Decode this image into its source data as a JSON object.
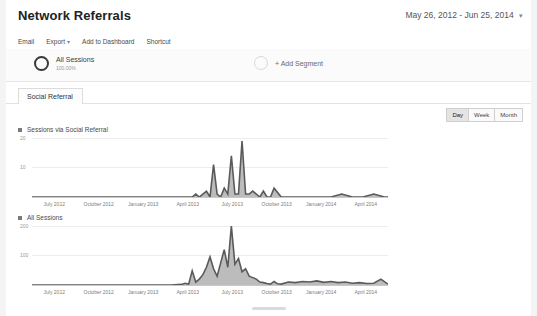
{
  "header": {
    "title": "Network Referrals",
    "date_range": "May 26, 2012 - Jun 25, 2014",
    "date_caret": "▾"
  },
  "toolbar": {
    "email": "Email",
    "export": "Export",
    "export_caret": "▾",
    "add_to_dashboard": "Add to Dashboard",
    "shortcut": "Shortcut"
  },
  "segments": {
    "all_sessions_name": "All Sessions",
    "all_sessions_pct": "100.00%",
    "add_segment": "+ Add Segment"
  },
  "tabs": [
    {
      "label": "Social Referral",
      "active": true
    }
  ],
  "granularity": [
    {
      "label": "Day",
      "active": true
    },
    {
      "label": "Week",
      "active": false
    },
    {
      "label": "Month",
      "active": false
    }
  ],
  "chart_data": [
    {
      "type": "area",
      "title": "Sessions via Social Referral",
      "xlabel": "",
      "ylabel": "",
      "ylim": [
        0,
        20
      ],
      "ytick_labels": [
        "20",
        "10"
      ],
      "grid": true,
      "legend_position": "top-left",
      "xtick_labels": [
        "July 2012",
        "October 2012",
        "January 2013",
        "April 2013",
        "July 2013",
        "October 2013",
        "January 2014",
        "April 2014"
      ],
      "x": [
        0,
        3,
        6,
        9,
        12,
        15,
        18,
        21,
        24,
        27,
        30,
        33,
        36,
        39,
        42,
        45,
        46,
        47,
        48,
        49,
        50,
        51,
        52,
        53,
        54,
        55,
        56,
        57,
        58,
        59,
        60,
        61,
        62,
        63,
        64,
        65,
        66,
        67,
        68,
        70,
        72,
        75,
        78,
        81,
        84,
        87,
        90,
        93,
        96,
        99,
        100
      ],
      "values": [
        0,
        0,
        0,
        0,
        0,
        0,
        0,
        0,
        0,
        0,
        0,
        0,
        0,
        0,
        0,
        0,
        1,
        0,
        1,
        2,
        0,
        11,
        1,
        0,
        3,
        1,
        14,
        1,
        1,
        19,
        1,
        1,
        2,
        1,
        0,
        2,
        0,
        0,
        3,
        0,
        0,
        0,
        0,
        0,
        0,
        1,
        0,
        0,
        1,
        0,
        0
      ]
    },
    {
      "type": "area",
      "title": "All Sessions",
      "xlabel": "",
      "ylabel": "",
      "ylim": [
        0,
        200
      ],
      "ytick_labels": [
        "200",
        "100"
      ],
      "grid": true,
      "legend_position": "top-left",
      "xtick_labels": [
        "July 2012",
        "October 2012",
        "January 2013",
        "April 2013",
        "July 2013",
        "October 2013",
        "January 2014",
        "April 2014"
      ],
      "x": [
        0,
        3,
        6,
        9,
        12,
        15,
        18,
        21,
        24,
        27,
        30,
        33,
        36,
        39,
        42,
        43,
        44,
        45,
        46,
        47,
        48,
        49,
        50,
        51,
        52,
        53,
        54,
        55,
        56,
        57,
        58,
        59,
        60,
        61,
        62,
        63,
        64,
        65,
        66,
        67,
        68,
        69,
        70,
        72,
        74,
        76,
        78,
        80,
        82,
        84,
        86,
        88,
        90,
        92,
        94,
        96,
        98,
        100
      ],
      "values": [
        0,
        0,
        0,
        0,
        0,
        0,
        0,
        0,
        0,
        0,
        0,
        0,
        0,
        0,
        2,
        6,
        3,
        48,
        10,
        20,
        35,
        60,
        95,
        55,
        30,
        75,
        120,
        60,
        200,
        70,
        90,
        45,
        55,
        30,
        25,
        20,
        10,
        8,
        5,
        3,
        12,
        4,
        3,
        10,
        8,
        12,
        10,
        14,
        9,
        12,
        8,
        10,
        6,
        8,
        5,
        6,
        20,
        3
      ]
    }
  ]
}
